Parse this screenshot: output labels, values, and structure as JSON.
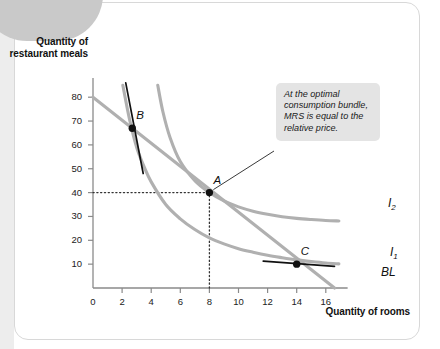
{
  "figure": {
    "y_axis_title": "Quantity of restaurant meals",
    "x_axis_title": "Quantity of rooms",
    "callout_text": "At the optimal consumption bundle, MRS is equal to the relative price."
  },
  "chart_data": {
    "type": "line",
    "title": "",
    "xlabel": "Quantity of rooms",
    "ylabel": "Quantity of restaurant meals",
    "xlim": [
      0,
      17.5
    ],
    "ylim": [
      0,
      88
    ],
    "grid": false,
    "legend": "inline-curve-labels",
    "x_ticks": [
      0,
      2,
      4,
      6,
      8,
      10,
      12,
      14,
      16
    ],
    "x_tick_labels": [
      "0",
      "2",
      "4",
      "6",
      "8",
      "10",
      "12",
      "14",
      "16"
    ],
    "y_ticks": [
      10,
      20,
      30,
      40,
      50,
      60,
      70,
      80
    ],
    "y_tick_labels": [
      "10",
      "20",
      "30",
      "40",
      "50",
      "60",
      "70",
      "80"
    ],
    "series": [
      {
        "name": "BL",
        "label": "BL",
        "type": "budget-line",
        "color": "#b0b0b0",
        "x": [
          0,
          16.6
        ],
        "values": [
          80,
          0
        ]
      },
      {
        "name": "I1",
        "label": "I",
        "label_sub": "1",
        "type": "indifference-curve",
        "color": "#b0b0b0",
        "x": [
          2.05,
          2.5,
          3,
          3.5,
          4,
          5,
          6,
          7,
          8,
          9,
          10,
          11,
          12,
          13,
          14,
          15,
          16,
          16.9
        ],
        "values": [
          85,
          71,
          59,
          51,
          44.5,
          35,
          29,
          24.5,
          21,
          18.5,
          16.5,
          15,
          13.7,
          12.7,
          11.8,
          11.1,
          10.5,
          10.1
        ]
      },
      {
        "name": "I2",
        "label": "I",
        "label_sub": "2",
        "type": "indifference-curve",
        "color": "#b0b0b0",
        "x": [
          4.45,
          4.8,
          5.3,
          6,
          7,
          8,
          9,
          10,
          11,
          12,
          13,
          14,
          15,
          16,
          16.9
        ],
        "values": [
          85,
          74,
          63,
          53,
          45,
          40,
          36.5,
          34,
          32.2,
          30.9,
          29.9,
          29.2,
          28.7,
          28.3,
          28.1
        ]
      }
    ],
    "points": [
      {
        "name": "A",
        "label": "A",
        "x": 8,
        "y": 40,
        "marker": "filled-circle",
        "color": "#111111"
      },
      {
        "name": "B",
        "label": "B",
        "x": 2.7,
        "y": 67,
        "marker": "filled-circle",
        "color": "#111111"
      },
      {
        "name": "C",
        "label": "C",
        "x": 14,
        "y": 10,
        "marker": "filled-circle",
        "color": "#111111"
      }
    ],
    "tangent_lines": [
      {
        "name": "tangent-at-B",
        "at_point": "B",
        "x": [
          2.25,
          3.45
        ],
        "values": [
          86,
          48
        ],
        "color": "#111111"
      },
      {
        "name": "tangent-at-C",
        "at_point": "C",
        "x": [
          11.7,
          16.6
        ],
        "values": [
          11.3,
          9.1
        ],
        "color": "#111111"
      }
    ],
    "guide_lines": [
      {
        "name": "guide-horizontal-40",
        "orientation": "horizontal",
        "value": 40,
        "from": 0,
        "to": 8,
        "style": "dotted"
      },
      {
        "name": "guide-vertical-8",
        "orientation": "vertical",
        "value": 8,
        "from": 0,
        "to": 40,
        "style": "dotted"
      }
    ],
    "annotations": [
      {
        "name": "mrs-callout",
        "text": "At the optimal consumption bundle, MRS is equal to the relative price.",
        "points_to": "A"
      }
    ]
  }
}
